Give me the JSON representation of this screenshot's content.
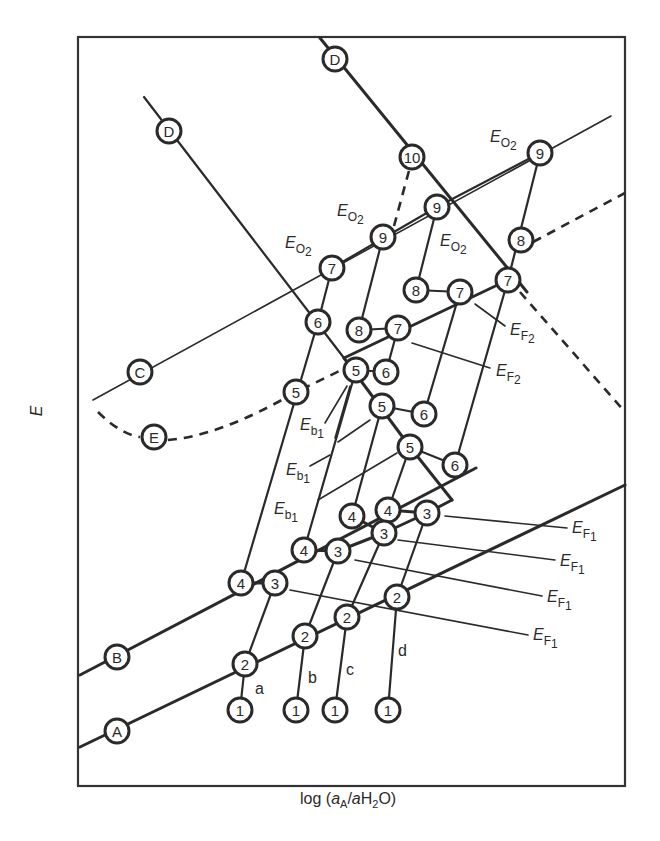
{
  "figure": {
    "x_axis_label": "log (aA/aH2O)",
    "x_axis_parts": {
      "pre": "log (",
      "a1": "a",
      "sub1": "A",
      "slash": "/",
      "a2": "a",
      "h": "H",
      "sub2": "2",
      "o": "O)"
    },
    "y_axis_label": "E"
  },
  "lines": [
    {
      "id": "A",
      "style": "thick",
      "label": "A"
    },
    {
      "id": "B",
      "style": "thick",
      "label": "B"
    },
    {
      "id": "C",
      "style": "thin",
      "label": "C"
    },
    {
      "id": "D",
      "style": "thick",
      "label": "D"
    },
    {
      "id": "E",
      "style": "dashed",
      "label": "E"
    }
  ],
  "paths": [
    {
      "id": "a",
      "label": "a"
    },
    {
      "id": "b",
      "label": "b"
    },
    {
      "id": "c",
      "label": "c"
    },
    {
      "id": "d",
      "label": "d"
    }
  ],
  "labels": {
    "eo2": {
      "main": "E",
      "sub": "O",
      "subsub": "2"
    },
    "ef1": {
      "main": "E",
      "sub": "F",
      "subsub": "1"
    },
    "ef2": {
      "main": "E",
      "sub": "F",
      "subsub": "2"
    },
    "eb1": {
      "main": "E",
      "sub": "b",
      "subsub": "1"
    }
  },
  "nodes": {
    "D_top": "D",
    "D_left": "D",
    "C": "C",
    "E": "E",
    "B": "B",
    "A": "A",
    "n10": "10",
    "n9a": "9",
    "n9b": "9",
    "n9c": "9",
    "n8a": "8",
    "n8b": "8",
    "n8c": "8",
    "n7a": "7",
    "n7b": "7",
    "n7c": "7",
    "n7d": "7",
    "n6a": "6",
    "n6b": "6",
    "n6c": "6",
    "n6d": "6",
    "n5a": "5",
    "n5b": "5",
    "n5c": "5",
    "n5d": "5",
    "n4a": "4",
    "n4b": "4",
    "n4c": "4",
    "n4d": "4",
    "n3a": "3",
    "n3b": "3",
    "n3c": "3",
    "n3d": "3",
    "n2a": "2",
    "n2b": "2",
    "n2c": "2",
    "n2d": "2",
    "n1a": "1",
    "n1b": "1",
    "n1c": "1",
    "n1d": "1"
  }
}
